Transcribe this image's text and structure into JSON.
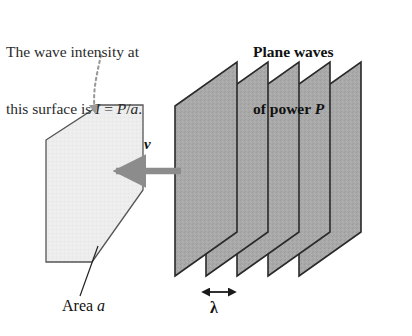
{
  "figure": {
    "kind": "physics-diagram",
    "background_color": "#ffffff"
  },
  "annotations": {
    "intensity_note": {
      "line1": "The wave intensity at",
      "line2_pre": "this surface is ",
      "line2_sym1": "I",
      "line2_mid": " = ",
      "line2_sym2": "P",
      "line2_slash": "/",
      "line2_sym3": "a",
      "line2_end": "."
    },
    "plane_waves_note": {
      "line1": "Plane waves",
      "line2_pre": "of power ",
      "line2_sym": "P"
    },
    "area_label": {
      "text_pre": "Area ",
      "symbol": "a"
    },
    "velocity_label": {
      "symbol": "v"
    },
    "wavelength_label": {
      "symbol": "λ"
    }
  },
  "colors": {
    "wave_plane_fill": "#a9a9a9",
    "wave_plane_stroke": "#2a2a2a",
    "surface_fill": "#ededed",
    "surface_stroke": "#555555",
    "velocity_arrow": "#8c8c8c",
    "pointer_arrow": "#9a9a9a",
    "leader_line": "#222222",
    "text": "#1a1a1a"
  },
  "geometry": {
    "wave_planes_count": 5,
    "wave_plane_left_x": [
      175,
      206,
      237,
      268,
      299
    ],
    "wave_plane_top_y": 62,
    "wave_plane_bottom_y": 276,
    "wave_plane_slant_dx": 62,
    "wave_plane_slant_dy": -44,
    "surface_polygon": "46,140 100,105 143,105 143,190 92,262 46,262",
    "velocity_arrow_from_x": 181,
    "velocity_arrow_to_x": 110,
    "velocity_arrow_y": 171,
    "wavelength_arrow_x1": 202,
    "wavelength_arrow_x2": 236,
    "wavelength_arrow_y": 292,
    "leader_line_from": "80,295",
    "leader_line_to": "98,246"
  }
}
